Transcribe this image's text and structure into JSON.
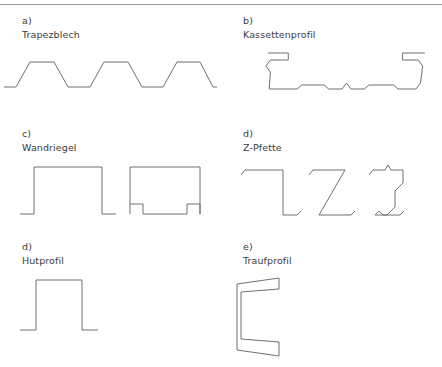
{
  "figure": {
    "line_color": "#6f6f6f",
    "text_color": "#3b3b3b",
    "background": "#ffffff",
    "rule_color": "#9a9a9a"
  },
  "cells": [
    {
      "index": "a)",
      "name": "Trapezblech",
      "shape": "trapezoidal-sheet",
      "path": "M4,45 L16,45 L30,20 L54,20 L68,45 L90,45 L104,20 L128,20 L142,45 L163,45 L177,20 L200,20 L213,45 L217,45"
    },
    {
      "index": "b)",
      "name": "Kassettenprofil",
      "shape": "cassette-profile",
      "path": "M26,11 L44,11 L44,18 L28,18 L24,24 L28,30 L27,47 L52,47 L56,43 L76,43 L80,47 L92,47 L96,41 L100,47 L112,47 L116,43 L138,43 L142,47 L158,47 L162,41 L164,24 L160,18 L146,18 L146,11 L166,11"
    },
    {
      "index": "c)",
      "name": "Wandriegel",
      "shape": "channel-sections",
      "paths": [
        "M6,59 L20,59 L20,12 L88,12 L88,59 L102,59",
        "M116,59 L116,12 L186,12 L186,59 L186,49 L173,49 L173,59 L129,59 L129,49 L116,49"
      ]
    },
    {
      "index": "d)",
      "name": "Z-Pfette",
      "shape": "z-purlins",
      "paths": [
        "M6,20 L10,15 L48,15 L48,60 L62,60 L66,56",
        "M74,20 L78,15 L110,15 L84,60 L116,60 L120,56",
        "M134,20 L138,15 L150,15 L153,10 L156,15 L168,15 L168,28 L160,36 L160,52 L152,60 L140,60 L144,56 L148,60 L165,60 L169,56"
      ]
    },
    {
      "index": "d)",
      "name": "Hutprofil",
      "shape": "hat-profile",
      "path": "M6,62 L22,62 L22,12 L68,12 L68,62 L84,62"
    },
    {
      "index": "e)",
      "name": "Traufprofil",
      "shape": "eaves-profile",
      "path": "M52,14 L10,20 L10,86 L52,92 L52,78 L14,75 L14,28 L52,25 Z"
    }
  ]
}
